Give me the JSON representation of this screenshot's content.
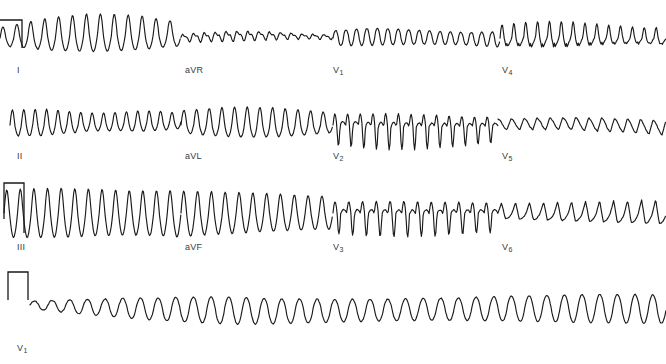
{
  "document": {
    "title": "12-lead electrocardiogram",
    "background_color": "#ffffff",
    "trace_color": "#1a1a1a",
    "label_color": "#3b3b3b",
    "width": 666,
    "height": 364
  },
  "rows": [
    {
      "name": "row-1",
      "baseline_y": 38,
      "leads": [
        {
          "id": "I",
          "label": "I",
          "subscript": "",
          "label_x": 17,
          "label_y": 66,
          "segment_x0": 0,
          "segment_x1": 181,
          "calibration": "partial-step-left-cut",
          "morphology": "coarse-ventricular-flutter",
          "cycles": 13,
          "amplitude": 19,
          "polarity": "positive"
        },
        {
          "id": "aVR",
          "label": "aVR",
          "subscript": "",
          "label_x": 185,
          "label_y": 66,
          "segment_x0": 181,
          "segment_x1": 333,
          "calibration": "none",
          "morphology": "low-amplitude-fibrillatory",
          "cycles": 14,
          "amplitude": 5,
          "polarity": "positive"
        },
        {
          "id": "V1",
          "label": "V",
          "subscript": "1",
          "label_x": 333,
          "label_y": 66,
          "segment_x0": 333,
          "segment_x1": 500,
          "calibration": "none",
          "morphology": "regular-sine-flutter",
          "cycles": 16,
          "amplitude": 8,
          "polarity": "positive"
        },
        {
          "id": "V4",
          "label": "V",
          "subscript": "4",
          "label_x": 502,
          "label_y": 66,
          "segment_x0": 500,
          "segment_x1": 666,
          "calibration": "none",
          "morphology": "sharp-notched-flutter",
          "cycles": 14,
          "amplitude": 15,
          "polarity": "positive"
        }
      ]
    },
    {
      "name": "row-2",
      "baseline_y": 125,
      "leads": [
        {
          "id": "II",
          "label": "II",
          "subscript": "",
          "label_x": 17,
          "label_y": 152,
          "segment_x0": 10,
          "segment_x1": 181,
          "calibration": "none",
          "morphology": "coarse-ventricular-flutter",
          "cycles": 15,
          "amplitude": 13,
          "polarity": "biphasic"
        },
        {
          "id": "aVL",
          "label": "aVL",
          "subscript": "",
          "label_x": 185,
          "label_y": 152,
          "segment_x0": 181,
          "segment_x1": 333,
          "calibration": "none",
          "morphology": "tall-rounded-flutter",
          "cycles": 12,
          "amplitude": 18,
          "polarity": "positive"
        },
        {
          "id": "V2",
          "label": "V",
          "subscript": "2",
          "label_x": 333,
          "label_y": 152,
          "segment_x0": 333,
          "segment_x1": 498,
          "calibration": "none",
          "morphology": "deep-negative-flutter",
          "cycles": 13,
          "amplitude": 22,
          "polarity": "negative"
        },
        {
          "id": "V5",
          "label": "V",
          "subscript": "5",
          "label_x": 502,
          "label_y": 152,
          "segment_x0": 498,
          "segment_x1": 666,
          "calibration": "none",
          "morphology": "sawtooth-low-amplitude",
          "cycles": 13,
          "amplitude": 9,
          "polarity": "positive"
        }
      ]
    },
    {
      "name": "row-3",
      "baseline_y": 213,
      "leads": [
        {
          "id": "III",
          "label": "III",
          "subscript": "",
          "label_x": 17,
          "label_y": 243,
          "segment_x0": 4,
          "segment_x1": 181,
          "calibration": "half-step",
          "morphology": "deep-coarse-flutter",
          "cycles": 13,
          "amplitude": 24,
          "polarity": "biphasic"
        },
        {
          "id": "aVF",
          "label": "aVF",
          "subscript": "",
          "label_x": 185,
          "label_y": 243,
          "segment_x0": 181,
          "segment_x1": 333,
          "calibration": "none",
          "morphology": "deep-coarse-flutter",
          "cycles": 11,
          "amplitude": 23,
          "polarity": "biphasic"
        },
        {
          "id": "V3",
          "label": "V",
          "subscript": "3",
          "label_x": 333,
          "label_y": 243,
          "segment_x0": 333,
          "segment_x1": 498,
          "calibration": "none",
          "morphology": "deep-negative-flutter",
          "cycles": 12,
          "amplitude": 22,
          "polarity": "negative"
        },
        {
          "id": "V6",
          "label": "V",
          "subscript": "6",
          "label_x": 502,
          "label_y": 243,
          "segment_x0": 498,
          "segment_x1": 666,
          "calibration": "none",
          "morphology": "peaked-flutter",
          "cycles": 12,
          "amplitude": 14,
          "polarity": "positive"
        }
      ]
    },
    {
      "name": "row-4-rhythm-strip",
      "baseline_y": 305,
      "leads": [
        {
          "id": "V1-rhythm",
          "label": "V",
          "subscript": "1",
          "label_x": 17,
          "label_y": 344,
          "segment_x0": 30,
          "segment_x1": 666,
          "calibration": "full-rectangular-pulse",
          "morphology": "continuous-sine-flutter",
          "cycles": 36,
          "amplitude": 11,
          "polarity": "positive"
        }
      ]
    }
  ],
  "chart_data": {
    "type": "line",
    "xlabel": "",
    "ylabel": "",
    "grid": false,
    "legend": "none",
    "series": [
      {
        "name": "I",
        "cycles": 13,
        "amplitude_px": 19,
        "baseline_y": 38
      },
      {
        "name": "aVR",
        "cycles": 14,
        "amplitude_px": 5,
        "baseline_y": 38
      },
      {
        "name": "V1",
        "cycles": 16,
        "amplitude_px": 8,
        "baseline_y": 38
      },
      {
        "name": "V4",
        "cycles": 14,
        "amplitude_px": 15,
        "baseline_y": 38
      },
      {
        "name": "II",
        "cycles": 15,
        "amplitude_px": 13,
        "baseline_y": 125
      },
      {
        "name": "aVL",
        "cycles": 12,
        "amplitude_px": 18,
        "baseline_y": 125
      },
      {
        "name": "V2",
        "cycles": 13,
        "amplitude_px": 22,
        "baseline_y": 125
      },
      {
        "name": "V5",
        "cycles": 13,
        "amplitude_px": 9,
        "baseline_y": 125
      },
      {
        "name": "III",
        "cycles": 13,
        "amplitude_px": 24,
        "baseline_y": 213
      },
      {
        "name": "aVF",
        "cycles": 11,
        "amplitude_px": 23,
        "baseline_y": 213
      },
      {
        "name": "V3",
        "cycles": 12,
        "amplitude_px": 22,
        "baseline_y": 213
      },
      {
        "name": "V6",
        "cycles": 12,
        "amplitude_px": 14,
        "baseline_y": 213
      },
      {
        "name": "V1-rhythm",
        "cycles": 36,
        "amplitude_px": 11,
        "baseline_y": 305
      }
    ]
  }
}
